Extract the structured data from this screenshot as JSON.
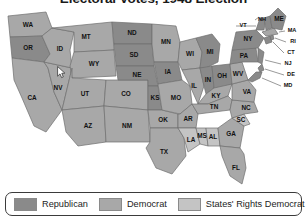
{
  "title": "Electoral Votes, 1948 Election",
  "legend": {
    "items": [
      {
        "label": "Republican",
        "color": "#8a8a8a"
      },
      {
        "label": "Democrat",
        "color": "#a8a8a8"
      },
      {
        "label": "States' Rights Democrat",
        "color": "#c4c4c4"
      }
    ]
  },
  "colors": {
    "republican": "#8a8a8a",
    "democrat": "#a8a8a8",
    "states_rights_democrat": "#c4c4c4",
    "border": "#6e6e6e",
    "label": "#111111",
    "legend_border": "#3b3b3b",
    "background": "#ffffff"
  },
  "chart_data": {
    "type": "map",
    "title": "Electoral Votes, 1948 Election",
    "legend_position": "bottom",
    "categories": [
      "Republican",
      "Democrat",
      "States' Rights Democrat"
    ],
    "states": [
      {
        "abbr": "WA",
        "party": "Democrat"
      },
      {
        "abbr": "OR",
        "party": "Republican"
      },
      {
        "abbr": "CA",
        "party": "Democrat"
      },
      {
        "abbr": "NV",
        "party": "Democrat"
      },
      {
        "abbr": "ID",
        "party": "Democrat"
      },
      {
        "abbr": "MT",
        "party": "Democrat"
      },
      {
        "abbr": "WY",
        "party": "Democrat"
      },
      {
        "abbr": "UT",
        "party": "Democrat"
      },
      {
        "abbr": "CO",
        "party": "Democrat"
      },
      {
        "abbr": "AZ",
        "party": "Democrat"
      },
      {
        "abbr": "NM",
        "party": "Democrat"
      },
      {
        "abbr": "ND",
        "party": "Republican"
      },
      {
        "abbr": "SD",
        "party": "Republican"
      },
      {
        "abbr": "NE",
        "party": "Republican"
      },
      {
        "abbr": "KS",
        "party": "Republican"
      },
      {
        "abbr": "OK",
        "party": "Democrat"
      },
      {
        "abbr": "TX",
        "party": "Democrat"
      },
      {
        "abbr": "MN",
        "party": "Democrat"
      },
      {
        "abbr": "IA",
        "party": "Republican"
      },
      {
        "abbr": "MO",
        "party": "Democrat"
      },
      {
        "abbr": "AR",
        "party": "Democrat"
      },
      {
        "abbr": "LA",
        "party": "States' Rights Democrat"
      },
      {
        "abbr": "WI",
        "party": "Democrat"
      },
      {
        "abbr": "IL",
        "party": "Democrat"
      },
      {
        "abbr": "MS",
        "party": "States' Rights Democrat"
      },
      {
        "abbr": "AL",
        "party": "States' Rights Democrat"
      },
      {
        "abbr": "MI",
        "party": "Republican"
      },
      {
        "abbr": "IN",
        "party": "Republican"
      },
      {
        "abbr": "OH",
        "party": "Republican"
      },
      {
        "abbr": "KY",
        "party": "Democrat"
      },
      {
        "abbr": "TN",
        "party": "Democrat"
      },
      {
        "abbr": "GA",
        "party": "Democrat"
      },
      {
        "abbr": "FL",
        "party": "Democrat"
      },
      {
        "abbr": "SC",
        "party": "States' Rights Democrat"
      },
      {
        "abbr": "NC",
        "party": "Democrat"
      },
      {
        "abbr": "VA",
        "party": "Democrat"
      },
      {
        "abbr": "WV",
        "party": "Democrat"
      },
      {
        "abbr": "PA",
        "party": "Republican"
      },
      {
        "abbr": "NY",
        "party": "Republican"
      },
      {
        "abbr": "NJ",
        "party": "Republican"
      },
      {
        "abbr": "DE",
        "party": "Republican"
      },
      {
        "abbr": "MD",
        "party": "Republican"
      },
      {
        "abbr": "CT",
        "party": "Republican"
      },
      {
        "abbr": "RI",
        "party": "Republican"
      },
      {
        "abbr": "MA",
        "party": "Democrat"
      },
      {
        "abbr": "VT",
        "party": "Republican"
      },
      {
        "abbr": "NH",
        "party": "Republican"
      },
      {
        "abbr": "ME",
        "party": "Republican"
      }
    ]
  }
}
